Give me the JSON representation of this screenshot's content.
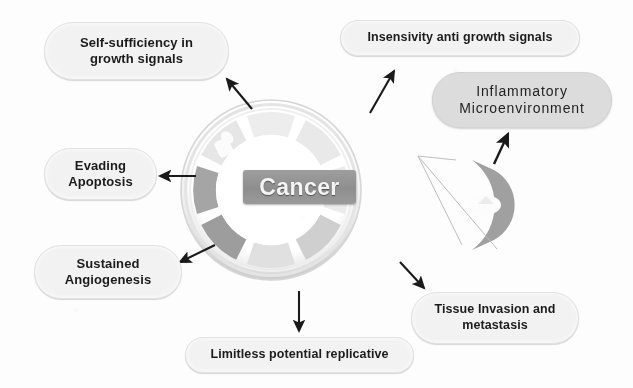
{
  "figure": {
    "title_text": "Cancer",
    "center_label": "Cancer"
  },
  "hallmarks": [
    {
      "id": "self-sufficiency",
      "label": "Self-sufficiency in\ngrowth signals",
      "line1": "Self-sufficiency in",
      "line2": "growth signals"
    },
    {
      "id": "insensitivity",
      "label": "Insensivity anti growth signals",
      "line1": "Insensivity anti growth signals",
      "line2": ""
    },
    {
      "id": "inflammatory",
      "label": "Inflammatory\nMicroenvironment",
      "line1": "Inflammatory",
      "line2": "Microenvironment"
    },
    {
      "id": "evading-apoptosis",
      "label": "Evading\nApoptosis",
      "line1": "Evading",
      "line2": "Apoptosis"
    },
    {
      "id": "sustained-angiogenesis",
      "label": "Sustained\nAngiogenesis",
      "line1": "Sustained",
      "line2": "Angiogenesis"
    },
    {
      "id": "limitless-replicative",
      "label": "Limitless potential replicative",
      "line1": "Limitless potential replicative",
      "line2": ""
    },
    {
      "id": "tissue-invasion",
      "label": "Tissue Invasion and\nmetastasis",
      "line1": "Tissue Invasion and",
      "line2": "metastasis"
    }
  ],
  "colors": {
    "pill_background": "#f2f2f2",
    "pill_text": "#1b1b1b",
    "inflammatory_pill_background": "#dcdcdc",
    "center_label_background": "#939393",
    "center_label_text": "#f4f4f4",
    "ring_segment_dark": "#9d9d9d",
    "ring_segment_light": "#e8e8e8",
    "ring_rim": "#dcdcdc",
    "arrow": "#1a1a1a",
    "callout_line": "#b9b9b9",
    "page_background": "#fdfdfd"
  },
  "icons": {
    "ring_segment": "ring-segment-icon",
    "callout_cell": "callout-cell-icon",
    "arrow": "arrow-icon"
  }
}
